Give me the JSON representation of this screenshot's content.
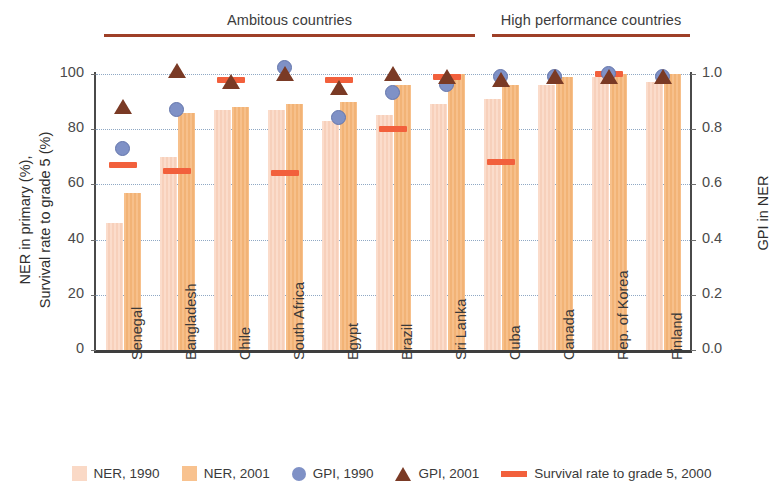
{
  "groups": [
    {
      "label": "Ambitous countries",
      "start_index": 0,
      "end_index": 6
    },
    {
      "label": "High performance countries",
      "start_index": 7,
      "end_index": 10
    }
  ],
  "axes": {
    "left": {
      "title": "NER in primary (%),\nSurvival rate to grade 5 (%)",
      "title_line1": "NER in primary (%),",
      "title_line2": "Survival rate to grade 5 (%)",
      "ticks": [
        "0",
        "20",
        "40",
        "60",
        "80",
        "100"
      ],
      "min": 0,
      "max": 100
    },
    "right": {
      "title": "GPI in NER",
      "ticks": [
        "0.0",
        "0.2",
        "0.4",
        "0.6",
        "0.8",
        "1.0"
      ],
      "min": 0,
      "max": 1
    }
  },
  "legend": [
    {
      "name": "ner-1990",
      "label": "NER, 1990",
      "color": "#fad9c6",
      "shape": "square"
    },
    {
      "name": "ner-2001",
      "label": "NER, 2001",
      "color": "#f8c28f",
      "shape": "square"
    },
    {
      "name": "gpi-1990",
      "label": "GPI, 1990",
      "color": "#7f91c6",
      "shape": "circle"
    },
    {
      "name": "gpi-2001",
      "label": "GPI, 2001",
      "color": "#7a3a25",
      "shape": "triangle"
    },
    {
      "name": "survival-2000",
      "label": "Survival rate to grade 5, 2000",
      "color": "#f2603c",
      "shape": "bar"
    }
  ],
  "chart_data": {
    "type": "bar",
    "title": "",
    "xlabel": "",
    "ylabel": "NER in primary (%), Survival rate to grade 5 (%)",
    "y2label": "GPI in NER",
    "ylim": [
      0,
      100
    ],
    "y2lim": [
      0,
      1
    ],
    "grid": true,
    "legend_position": "bottom",
    "categories": [
      "Senegal",
      "Bangladesh",
      "Chile",
      "South Africa",
      "Egypt",
      "Brazil",
      "Sri Lanka",
      "Cuba",
      "Canada",
      "Rep. of Korea",
      "Finland"
    ],
    "series": [
      {
        "name": "NER, 1990",
        "axis": "left",
        "type": "bar",
        "color": "#fad9c6",
        "values": [
          46,
          70,
          87,
          87,
          83,
          85,
          89,
          91,
          96,
          99,
          97
        ]
      },
      {
        "name": "NER, 2001",
        "axis": "left",
        "type": "bar",
        "color": "#f8c28f",
        "values": [
          57,
          86,
          88,
          89,
          90,
          96,
          100,
          96,
          99,
          100,
          100
        ]
      },
      {
        "name": "GPI, 1990",
        "axis": "right",
        "type": "marker",
        "marker": "circle",
        "color": "#7f91c6",
        "values": [
          0.73,
          0.87,
          null,
          1.02,
          0.84,
          0.93,
          0.96,
          0.99,
          0.99,
          1.0,
          0.99
        ]
      },
      {
        "name": "GPI, 2001",
        "axis": "right",
        "type": "marker",
        "marker": "triangle",
        "color": "#7a3a25",
        "values": [
          0.88,
          1.01,
          0.97,
          1.0,
          0.95,
          1.0,
          0.99,
          0.98,
          0.99,
          0.99,
          0.99
        ]
      },
      {
        "name": "Survival rate to grade 5, 2000",
        "axis": "left",
        "type": "marker",
        "marker": "dash",
        "color": "#f2603c",
        "values": [
          67,
          65,
          98,
          64,
          98,
          80,
          99,
          68,
          null,
          100,
          null
        ]
      }
    ]
  }
}
